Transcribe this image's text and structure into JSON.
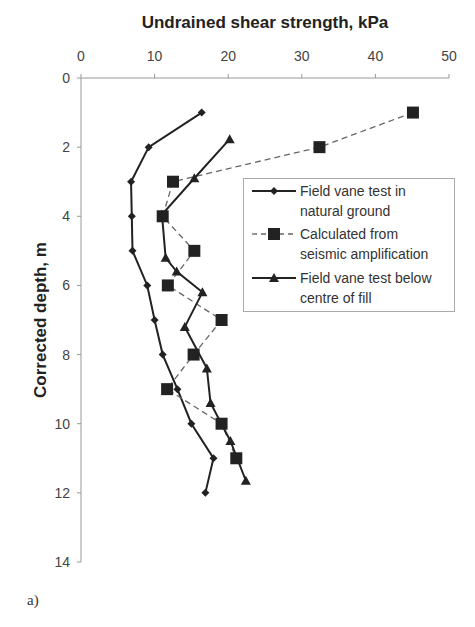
{
  "chart_data": {
    "type": "line",
    "title": "Undrained shear strength, kPa",
    "xlabel": "Undrained shear strength, kPa",
    "ylabel": "Corrected depth, m",
    "xlim": [
      0,
      50
    ],
    "ylim": [
      0,
      14
    ],
    "y_inverted": true,
    "x_axis_position": "top",
    "x_ticks": [
      0,
      10,
      20,
      30,
      40,
      50
    ],
    "y_ticks": [
      0,
      2,
      4,
      6,
      8,
      10,
      12,
      14
    ],
    "grid": false,
    "legend_position": "upper right inside",
    "series": [
      {
        "name": "Field vane test in natural ground",
        "legend_lines": [
          "Field vane test in",
          "natural ground"
        ],
        "marker": "diamond",
        "line": "solid",
        "points": [
          {
            "x": 16.4,
            "depth": 1.0
          },
          {
            "x": 9.2,
            "depth": 2.0
          },
          {
            "x": 6.8,
            "depth": 3.0
          },
          {
            "x": 6.9,
            "depth": 4.0
          },
          {
            "x": 7.0,
            "depth": 5.0
          },
          {
            "x": 9.0,
            "depth": 6.0
          },
          {
            "x": 10.0,
            "depth": 7.0
          },
          {
            "x": 11.1,
            "depth": 8.0
          },
          {
            "x": 13.1,
            "depth": 9.0
          },
          {
            "x": 15.0,
            "depth": 10.0
          },
          {
            "x": 18.0,
            "depth": 11.0
          },
          {
            "x": 16.9,
            "depth": 12.0
          }
        ]
      },
      {
        "name": "Calculated from seismic amplification",
        "legend_lines": [
          "Calculated from",
          "seismic amplification"
        ],
        "marker": "square",
        "line": "dashed",
        "points": [
          {
            "x": 45.1,
            "depth": 1.0
          },
          {
            "x": 32.4,
            "depth": 2.0
          },
          {
            "x": 12.5,
            "depth": 3.0
          },
          {
            "x": 11.1,
            "depth": 4.0
          },
          {
            "x": 15.4,
            "depth": 5.0
          },
          {
            "x": 11.8,
            "depth": 6.0
          },
          {
            "x": 19.1,
            "depth": 7.0
          },
          {
            "x": 15.3,
            "depth": 8.0
          },
          {
            "x": 11.7,
            "depth": 9.0
          },
          {
            "x": 19.1,
            "depth": 10.0
          },
          {
            "x": 21.1,
            "depth": 11.0
          }
        ]
      },
      {
        "name": "Field vane test below centre of fill",
        "legend_lines": [
          "Field vane test below",
          "centre of fill"
        ],
        "marker": "triangle",
        "line": "solid",
        "points": [
          {
            "x": 20.2,
            "depth": 1.77
          },
          {
            "x": 15.4,
            "depth": 2.9
          },
          {
            "x": 11.0,
            "depth": 3.95
          },
          {
            "x": 11.5,
            "depth": 5.2
          },
          {
            "x": 13.0,
            "depth": 5.6
          },
          {
            "x": 16.5,
            "depth": 6.2
          },
          {
            "x": 14.1,
            "depth": 7.2
          },
          {
            "x": 17.1,
            "depth": 8.4
          },
          {
            "x": 17.6,
            "depth": 9.4
          },
          {
            "x": 20.3,
            "depth": 10.5
          },
          {
            "x": 22.4,
            "depth": 11.65
          }
        ]
      }
    ]
  },
  "panel_label": "a)"
}
